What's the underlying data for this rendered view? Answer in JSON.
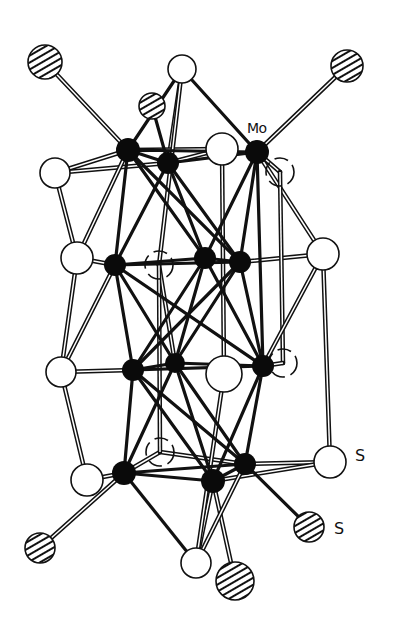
{
  "figure": {
    "labels": [
      {
        "id": "mo",
        "text": "Mo",
        "x": 247,
        "y": 120
      },
      {
        "id": "s1",
        "text": "S",
        "x": 355,
        "y": 446
      },
      {
        "id": "s2",
        "text": "S",
        "x": 334,
        "y": 519
      }
    ],
    "legend_styles": {
      "mo_atom": "solid-black",
      "s_bridging": "open-white",
      "s_terminal": "hatched",
      "s_hidden": "dashed-open"
    },
    "atoms": [
      {
        "id": "h1",
        "type": "hatched",
        "x": 45,
        "y": 62,
        "r": 17
      },
      {
        "id": "w1",
        "type": "open",
        "x": 182,
        "y": 69,
        "r": 14
      },
      {
        "id": "h2",
        "type": "hatched",
        "x": 152,
        "y": 106,
        "r": 13
      },
      {
        "id": "h3",
        "type": "hatched",
        "x": 347,
        "y": 66,
        "r": 16
      },
      {
        "id": "w2",
        "type": "open",
        "x": 222,
        "y": 149,
        "r": 16
      },
      {
        "id": "w3",
        "type": "open",
        "x": 55,
        "y": 173,
        "r": 15
      },
      {
        "id": "w4",
        "type": "dashed",
        "x": 280,
        "y": 172,
        "r": 14
      },
      {
        "id": "w5",
        "type": "open",
        "x": 77,
        "y": 258,
        "r": 16
      },
      {
        "id": "w6",
        "type": "dashed",
        "x": 159,
        "y": 265,
        "r": 14
      },
      {
        "id": "w7",
        "type": "open",
        "x": 323,
        "y": 254,
        "r": 16
      },
      {
        "id": "w8",
        "type": "open",
        "x": 61,
        "y": 372,
        "r": 15
      },
      {
        "id": "w9",
        "type": "open",
        "x": 224,
        "y": 374,
        "r": 18
      },
      {
        "id": "w10",
        "type": "dashed",
        "x": 283,
        "y": 363,
        "r": 14
      },
      {
        "id": "w11",
        "type": "dashed",
        "x": 160,
        "y": 452,
        "r": 14
      },
      {
        "id": "w12",
        "type": "open",
        "x": 87,
        "y": 480,
        "r": 16
      },
      {
        "id": "w13",
        "type": "open",
        "x": 330,
        "y": 462,
        "r": 16
      },
      {
        "id": "h4",
        "type": "hatched",
        "x": 309,
        "y": 527,
        "r": 15
      },
      {
        "id": "h5",
        "type": "hatched",
        "x": 40,
        "y": 548,
        "r": 15
      },
      {
        "id": "w14",
        "type": "open",
        "x": 196,
        "y": 563,
        "r": 15
      },
      {
        "id": "h6",
        "type": "hatched",
        "x": 235,
        "y": 581,
        "r": 19
      },
      {
        "id": "m1",
        "type": "mo",
        "x": 128,
        "y": 150,
        "r": 12
      },
      {
        "id": "m2",
        "type": "mo",
        "x": 168,
        "y": 163,
        "r": 11
      },
      {
        "id": "m3",
        "type": "mo",
        "x": 257,
        "y": 152,
        "r": 12
      },
      {
        "id": "m4",
        "type": "mo",
        "x": 115,
        "y": 265,
        "r": 11
      },
      {
        "id": "m5",
        "type": "mo",
        "x": 205,
        "y": 258,
        "r": 11
      },
      {
        "id": "m6",
        "type": "mo",
        "x": 240,
        "y": 262,
        "r": 11
      },
      {
        "id": "m7",
        "type": "mo",
        "x": 133,
        "y": 370,
        "r": 11
      },
      {
        "id": "m8",
        "type": "mo",
        "x": 175,
        "y": 363,
        "r": 10
      },
      {
        "id": "m9",
        "type": "mo",
        "x": 263,
        "y": 366,
        "r": 11
      },
      {
        "id": "m10",
        "type": "mo",
        "x": 124,
        "y": 473,
        "r": 12
      },
      {
        "id": "m11",
        "type": "mo",
        "x": 213,
        "y": 481,
        "r": 12
      },
      {
        "id": "m12",
        "type": "mo",
        "x": 245,
        "y": 464,
        "r": 11
      }
    ],
    "bonds_solid": [
      [
        "m1",
        "m2"
      ],
      [
        "m1",
        "m3"
      ],
      [
        "m2",
        "m3"
      ],
      [
        "m1",
        "w1"
      ],
      [
        "m2",
        "h2"
      ],
      [
        "m3",
        "w1"
      ],
      [
        "m1",
        "m4"
      ],
      [
        "m1",
        "m5"
      ],
      [
        "m1",
        "m6"
      ],
      [
        "m2",
        "m4"
      ],
      [
        "m2",
        "m5"
      ],
      [
        "m2",
        "m6"
      ],
      [
        "m3",
        "m5"
      ],
      [
        "m3",
        "m6"
      ],
      [
        "m3",
        "m9"
      ],
      [
        "m4",
        "m5"
      ],
      [
        "m5",
        "m6"
      ],
      [
        "m4",
        "m6"
      ],
      [
        "m4",
        "m7"
      ],
      [
        "m4",
        "m8"
      ],
      [
        "m4",
        "m9"
      ],
      [
        "m5",
        "m7"
      ],
      [
        "m5",
        "m8"
      ],
      [
        "m6",
        "m8"
      ],
      [
        "m6",
        "m9"
      ],
      [
        "m5",
        "m9"
      ],
      [
        "m6",
        "m7"
      ],
      [
        "m7",
        "m8"
      ],
      [
        "m8",
        "m9"
      ],
      [
        "m7",
        "m9"
      ],
      [
        "m7",
        "m10"
      ],
      [
        "m7",
        "m11"
      ],
      [
        "m8",
        "m10"
      ],
      [
        "m8",
        "m12"
      ],
      [
        "m9",
        "m11"
      ],
      [
        "m9",
        "m12"
      ],
      [
        "m7",
        "m12"
      ],
      [
        "m8",
        "m11"
      ],
      [
        "m10",
        "m11"
      ],
      [
        "m11",
        "m12"
      ],
      [
        "m10",
        "m12"
      ],
      [
        "m10",
        "w14"
      ],
      [
        "m12",
        "h4"
      ]
    ],
    "bonds_double": [
      [
        "h1",
        "m1"
      ],
      [
        "h3",
        "m3"
      ],
      [
        "w3",
        "m1"
      ],
      [
        "w3",
        "m2"
      ],
      [
        "w1",
        "m2"
      ],
      [
        "w2",
        "m2"
      ],
      [
        "w2",
        "m1"
      ],
      [
        "w3",
        "w5"
      ],
      [
        "w5",
        "m4"
      ],
      [
        "w5",
        "m1"
      ],
      [
        "w7",
        "m6"
      ],
      [
        "w7",
        "m3"
      ],
      [
        "w4",
        "m3"
      ],
      [
        "w2",
        "w9"
      ],
      [
        "w4",
        "w10"
      ],
      [
        "w5",
        "w8"
      ],
      [
        "w8",
        "m7"
      ],
      [
        "w8",
        "m4"
      ],
      [
        "w7",
        "w13"
      ],
      [
        "w7",
        "m9"
      ],
      [
        "w10",
        "m9"
      ],
      [
        "w8",
        "w12"
      ],
      [
        "w12",
        "m10"
      ],
      [
        "w11",
        "m10"
      ],
      [
        "w11",
        "m12"
      ],
      [
        "w13",
        "m12"
      ],
      [
        "w13",
        "m11"
      ],
      [
        "m10",
        "h5"
      ],
      [
        "m11",
        "h6"
      ],
      [
        "m11",
        "w14"
      ],
      [
        "m12",
        "w14"
      ],
      [
        "w9",
        "w14"
      ],
      [
        "w6",
        "m8"
      ],
      [
        "w6",
        "w1"
      ],
      [
        "w11",
        "w6"
      ]
    ]
  }
}
